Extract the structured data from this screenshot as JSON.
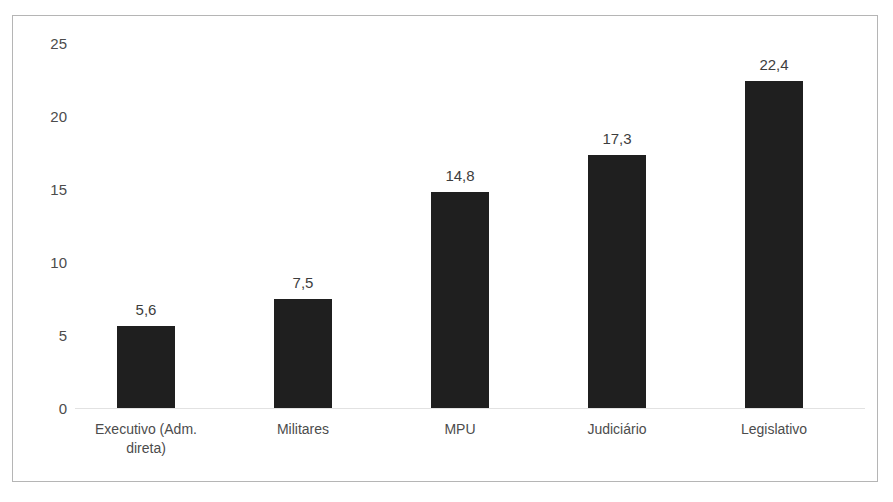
{
  "chart_data": {
    "type": "bar",
    "title": "",
    "subtitle": "",
    "xlabel": "",
    "ylabel": "",
    "categories": [
      "Executivo (Adm. direta)",
      "Militares",
      "MPU",
      "Judiciário",
      "Legislativo"
    ],
    "category_lines": [
      [
        "Executivo (Adm.",
        "direta)"
      ],
      [
        "Militares"
      ],
      [
        "MPU"
      ],
      [
        "Judiciário"
      ],
      [
        "Legislativo"
      ]
    ],
    "values": [
      5.6,
      7.5,
      14.8,
      17.3,
      22.4
    ],
    "value_labels": [
      "5,6",
      "7,5",
      "14,8",
      "17,3",
      "22,4"
    ],
    "ylim": [
      0,
      25
    ],
    "y_ticks": [
      0,
      5,
      10,
      15,
      20,
      25
    ],
    "y_tick_labels": [
      "0",
      "5",
      "10",
      "15",
      "20",
      "25"
    ],
    "grid": false,
    "legend": "none",
    "decimal_separator": ",",
    "bar_color": "#1f1f1f",
    "axis_line_color": "#e2e2e2",
    "frame_color": "#b5b5b5",
    "text_color": "#4c4c4c",
    "background_color": "#ffffff"
  }
}
